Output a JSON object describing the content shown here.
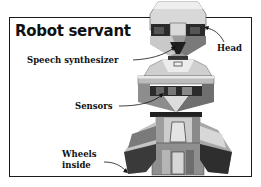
{
  "title": "Robot servant",
  "labels": {
    "head": "Head",
    "speech_synthesizer": "Speech synthesizer",
    "sensors": "Sensors",
    "wheels_line1": "Wheels",
    "wheels_line2": "inside"
  }
}
